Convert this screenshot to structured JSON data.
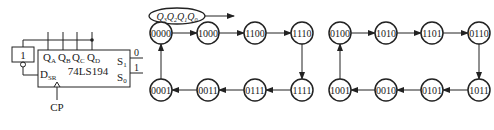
{
  "circuit": {
    "chip_label": "74LS194",
    "inverter_label": "1",
    "outputs": [
      {
        "name": "Q",
        "sub": "A"
      },
      {
        "name": "Q",
        "sub": "B"
      },
      {
        "name": "Q",
        "sub": "C"
      },
      {
        "name": "Q",
        "sub": "D"
      }
    ],
    "serial_input": {
      "name": "D",
      "sub": "SR"
    },
    "mode_inputs": [
      {
        "name": "S",
        "sub": "1",
        "value": "0"
      },
      {
        "name": "S",
        "sub": "0",
        "value": "1"
      }
    ],
    "clock_label": "CP"
  },
  "state_diagram": {
    "legend": [
      {
        "name": "Q",
        "sub": "3"
      },
      {
        "name": "Q",
        "sub": "2"
      },
      {
        "name": "Q",
        "sub": "1"
      },
      {
        "name": "Q",
        "sub": "0"
      }
    ],
    "cycle1": {
      "top": [
        "0000",
        "1000",
        "1100",
        "1110"
      ],
      "bottom": [
        "0001",
        "0011",
        "0111",
        "1111"
      ]
    },
    "cycle2": {
      "top": [
        "0100",
        "1010",
        "1101",
        "0110"
      ],
      "bottom": [
        "1001",
        "0010",
        "0101",
        "1011"
      ]
    }
  }
}
